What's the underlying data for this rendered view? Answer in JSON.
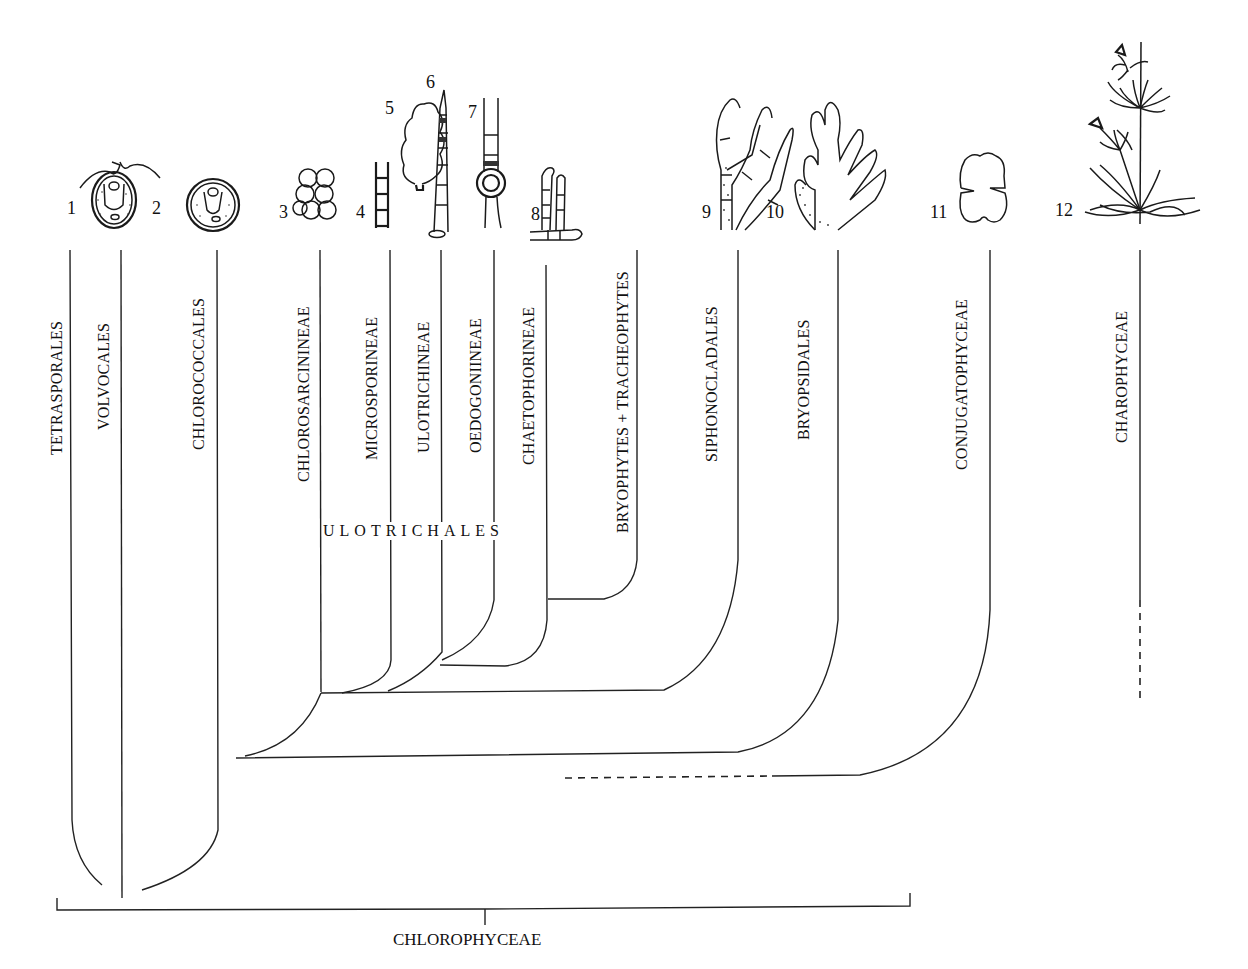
{
  "diagram": {
    "type": "phylogenetic-tree",
    "root_group": "CHLOROPHYCEAE",
    "subgroup": "ULOTRICHALES",
    "taxa": [
      {
        "label": "TETRASPORALES",
        "number": "1"
      },
      {
        "label": "VOLVOCALES",
        "number": "2"
      },
      {
        "label": "CHLOROCOCCALES",
        "number": ""
      },
      {
        "label": "CHLOROSARCININEAE",
        "number": "3"
      },
      {
        "label": "MICROSPORINEAE",
        "number": "4"
      },
      {
        "label": "ULOTRICHINEAE",
        "number": "5"
      },
      {
        "label": "OEDOGONIINEAE",
        "number": "7"
      },
      {
        "label": "CHAETOPHORINEAE",
        "number": "8"
      },
      {
        "label": "BRYOPHYTES + TRACHEOPHYTES",
        "number": ""
      },
      {
        "label": "SIPHONOCLADALES",
        "number": "9"
      },
      {
        "label": "BRYOPSIDALES",
        "number": "10"
      },
      {
        "label": "CONJUGATOPHYCEAE",
        "number": "11"
      },
      {
        "label": "CHAROPHYCEAE",
        "number": "12"
      }
    ],
    "illustration_numbers": [
      "1",
      "2",
      "3",
      "4",
      "5",
      "6",
      "7",
      "8",
      "9",
      "10",
      "11",
      "12"
    ],
    "illustrations": [
      {
        "number": "1-2",
        "depicts": "biflagellate unicell (Chlamydomonas-like)"
      },
      {
        "number": "2",
        "depicts": "non-motile spherical unicell (Chlorococcum-like)"
      },
      {
        "number": "3",
        "depicts": "packet of cells (Chlorosarcina-like)"
      },
      {
        "number": "4",
        "depicts": "H-piece filament (Microspora-like)"
      },
      {
        "number": "5",
        "depicts": "foliose thallus (Monostroma/Ulva-like)"
      },
      {
        "number": "6",
        "depicts": "unbranched filament with holdfast (Ulothrix-like)"
      },
      {
        "number": "7",
        "depicts": "filament with oogonium (Oedogonium-like)"
      },
      {
        "number": "8",
        "depicts": "branched filament (Chaetophora-like)"
      },
      {
        "number": "9",
        "depicts": "branched siphonocladous thallus (Cladophora-like)"
      },
      {
        "number": "10",
        "depicts": "siphonous branched thallus (Bryopsis-like)"
      },
      {
        "number": "11",
        "depicts": "desmid cell (Cosmarium-like)"
      },
      {
        "number": "12",
        "depicts": "whorled stonewort (Chara-like)"
      }
    ]
  },
  "labels": {
    "tetrasporales": "TETRASPORALES",
    "volvocales": "VOLVOCALES",
    "chlorococcales": "CHLOROCOCCALES",
    "chlorosarcinineae": "CHLOROSARCININEAE",
    "microsporineae": "MICROSPORINEAE",
    "ulotrichineae": "ULOTRICHINEAE",
    "oedogoniineae": "OEDOGONIINEAE",
    "chaetophorineae": "CHAETOPHORINEAE",
    "bryophytes": "BRYOPHYTES + TRACHEOPHYTES",
    "siphonocladales": "SIPHONOCLADALES",
    "bryopsidales": "BRYOPSIDALES",
    "conjugatophyceae": "CONJUGATOPHYCEAE",
    "charophyceae": "CHAROPHYCEAE",
    "ulotrichales": "ULOTRICHALES",
    "chlorophyceae": "CHLOROPHYCEAE"
  },
  "numbers": {
    "n1": "1",
    "n2": "2",
    "n3": "3",
    "n4": "4",
    "n5": "5",
    "n6": "6",
    "n7": "7",
    "n8": "8",
    "n9": "9",
    "n10": "10",
    "n11": "11",
    "n12": "12"
  }
}
